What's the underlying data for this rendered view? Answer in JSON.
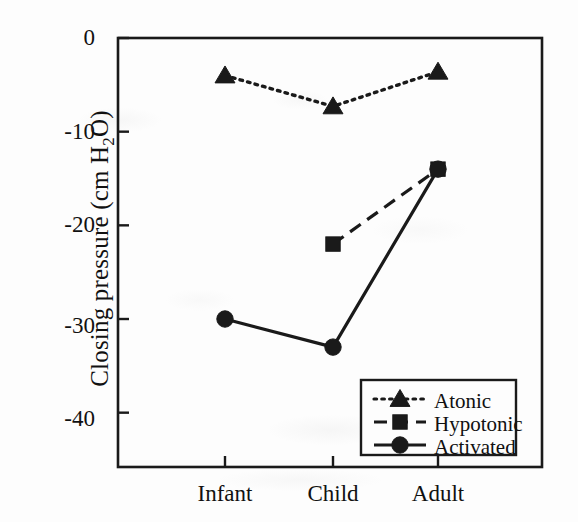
{
  "figure": {
    "background_color": "#fdfdfd",
    "ink_color": "#1a1a1a",
    "width": 578,
    "height": 522
  },
  "axes": {
    "ylabel_text": "Closing pressure (cm H",
    "ylabel_sub": "2",
    "ylabel_tail": "O)",
    "ylabel_full": "Closing pressure (cm H2O)",
    "xlabel": "",
    "ytick_labels": [
      "0",
      "-10",
      "-20",
      "-30",
      "-40"
    ],
    "xtick_labels": [
      "Infant",
      "Child",
      "Adult"
    ]
  },
  "legend": {
    "entries": [
      {
        "label": "Atonic",
        "style": "dotted",
        "marker": "triangle"
      },
      {
        "label": "Hypotonic",
        "style": "dashed",
        "marker": "square"
      },
      {
        "label": "Activated",
        "style": "solid",
        "marker": "circle"
      }
    ]
  },
  "chart_data": {
    "type": "line",
    "title": "",
    "xlabel": "",
    "ylabel": "Closing pressure (cm H2O)",
    "categories": [
      "Infant",
      "Child",
      "Adult"
    ],
    "x": [
      1,
      2,
      3
    ],
    "ylim": [
      -45.8,
      0
    ],
    "yticks": [
      0,
      -10,
      -20,
      -30,
      -40
    ],
    "grid": false,
    "legend_position": "lower right",
    "series": [
      {
        "name": "Atonic",
        "marker": "triangle",
        "linestyle": "dotted",
        "color": "#1a1a1a",
        "values": [
          -4.0,
          -7.3,
          -3.6
        ]
      },
      {
        "name": "Hypotonic",
        "marker": "square",
        "linestyle": "dashed",
        "color": "#1a1a1a",
        "values": [
          null,
          -22.0,
          -14.0
        ]
      },
      {
        "name": "Activated",
        "marker": "circle",
        "linestyle": "solid",
        "color": "#1a1a1a",
        "values": [
          -30.0,
          -33.0,
          -14.0
        ]
      }
    ]
  }
}
